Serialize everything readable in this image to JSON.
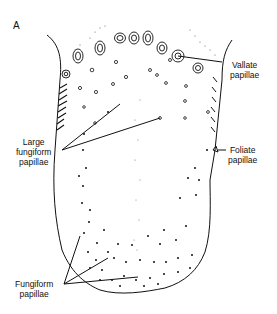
{
  "figure": {
    "panel_label": "A",
    "labels": {
      "vallate": [
        "Vallate",
        "papillae"
      ],
      "large_fungiform": [
        "Large",
        "fungiform",
        "papillae"
      ],
      "foliate": [
        "Foliate",
        "papillae"
      ],
      "fungiform": [
        "Fungiform",
        "papillae"
      ]
    },
    "colors": {
      "line": "#111111",
      "background": "#ffffff"
    }
  }
}
